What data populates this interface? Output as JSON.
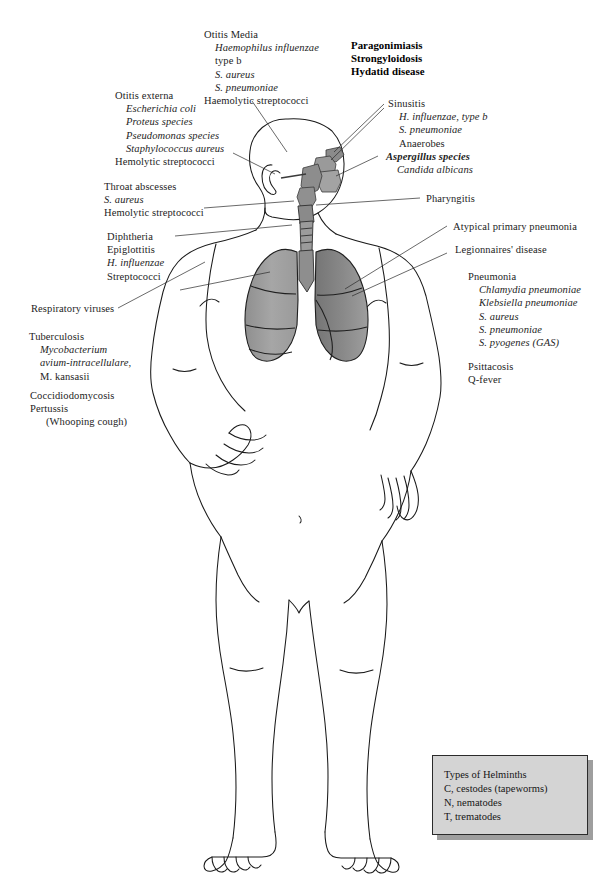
{
  "labels": {
    "otitis_media": {
      "name": "Otitis Media",
      "lines": [
        {
          "text": "Otitis Media",
          "style": "roman",
          "indent": 0
        },
        {
          "text": "Haemophilus influenzae",
          "style": "italic",
          "indent": 1
        },
        {
          "text": "type b",
          "style": "roman",
          "indent": 1
        },
        {
          "text": "S. aureus",
          "style": "italic",
          "indent": 1
        },
        {
          "text": "S. pneumoniae",
          "style": "italic",
          "indent": 1
        },
        {
          "text": "Haemolytic streptococci",
          "style": "roman",
          "indent": 0
        }
      ]
    },
    "helminth_diseases": {
      "name": "Helminth diseases",
      "lines": [
        {
          "text": "Paragonimiasis",
          "style": "roman",
          "indent": 0
        },
        {
          "text": "Strongyloidosis",
          "style": "roman",
          "indent": 0
        },
        {
          "text": "Hydatid disease",
          "style": "roman",
          "indent": 0
        }
      ]
    },
    "otitis_externa": {
      "name": "Otitis externa",
      "lines": [
        {
          "text": "Otitis externa",
          "style": "roman",
          "indent": 0
        },
        {
          "text": "Escherichia coli",
          "style": "italic",
          "indent": 1
        },
        {
          "text": "Proteus species",
          "style": "italic",
          "indent": 1
        },
        {
          "text": "Pseudomonas species",
          "style": "italic",
          "indent": 1
        },
        {
          "text": "Staphylococcus aureus",
          "style": "italic",
          "indent": 1
        },
        {
          "text": "Hemolytic streptococci",
          "style": "roman",
          "indent": 0
        }
      ]
    },
    "sinusitis": {
      "name": "Sinusitis",
      "lines": [
        {
          "text": "Sinusitis",
          "style": "roman",
          "indent": 0
        },
        {
          "text": "H. influenzae, type b",
          "style": "italic",
          "indent": 1
        },
        {
          "text": "S. pneumoniae",
          "style": "italic",
          "indent": 1
        },
        {
          "text": "Anaerobes",
          "style": "roman",
          "indent": 1
        }
      ]
    },
    "fungi": {
      "name": "Fungal pathogens",
      "lines": [
        {
          "text": "Aspergillus species",
          "style": "bolditalic",
          "indent": 0
        },
        {
          "text": "Candida albicans",
          "style": "italic",
          "indent": 1
        }
      ]
    },
    "throat_abscesses": {
      "name": "Throat abscesses",
      "lines": [
        {
          "text": "Throat abscesses",
          "style": "roman",
          "indent": 0
        },
        {
          "text": "S. aureus",
          "style": "italic",
          "indent": 0
        },
        {
          "text": "Hemolytic streptococci",
          "style": "roman",
          "indent": 0
        }
      ]
    },
    "pharyngitis": {
      "name": "Pharyngitis",
      "lines": [
        {
          "text": "Pharyngitis",
          "style": "roman",
          "indent": 0
        }
      ]
    },
    "diphtheria": {
      "name": "Diphtheria and epiglottitis",
      "lines": [
        {
          "text": "Diphtheria",
          "style": "roman",
          "indent": 0
        },
        {
          "text": "Epiglottitis",
          "style": "roman",
          "indent": 0
        },
        {
          "text": "H. influenzae",
          "style": "italic",
          "indent": 0
        },
        {
          "text": "Streptococci",
          "style": "roman",
          "indent": 0
        }
      ]
    },
    "atypical_pneumonia": {
      "name": "Atypical primary pneumonia",
      "lines": [
        {
          "text": "Atypical primary pneumonia",
          "style": "roman",
          "indent": 0
        }
      ]
    },
    "legionnaires": {
      "name": "Legionnaires' disease",
      "lines": [
        {
          "text": "Legionnaires' disease",
          "style": "roman",
          "indent": 0
        }
      ]
    },
    "respiratory_viruses": {
      "name": "Respiratory viruses",
      "lines": [
        {
          "text": "Respiratory viruses",
          "style": "roman",
          "indent": 0
        }
      ]
    },
    "pneumonia": {
      "name": "Pneumonia",
      "lines": [
        {
          "text": "Pneumonia",
          "style": "roman",
          "indent": 0
        },
        {
          "text": "Chlamydia pneumoniae",
          "style": "italic",
          "indent": 1
        },
        {
          "text": "Klebsiella pneumoniae",
          "style": "italic",
          "indent": 1
        },
        {
          "text": "S. aureus",
          "style": "italic",
          "indent": 1
        },
        {
          "text": "S. pneumoniae",
          "style": "italic",
          "indent": 1
        },
        {
          "text": "S. pyogenes (GAS)",
          "style": "italic",
          "indent": 1
        }
      ]
    },
    "tuberculosis": {
      "name": "Tuberculosis",
      "lines": [
        {
          "text": "Tuberculosis",
          "style": "roman",
          "indent": 0
        },
        {
          "text": "Mycobacterium",
          "style": "italic",
          "indent": 1
        },
        {
          "text": "avium-intracellulare,",
          "style": "italic",
          "indent": 1
        },
        {
          "text": "M. kansasii",
          "style": "roman",
          "indent": 1
        }
      ]
    },
    "psittacosis": {
      "name": "Psittacosis and Q-fever",
      "lines": [
        {
          "text": "Psittacosis",
          "style": "roman",
          "indent": 0
        },
        {
          "text": "Q-fever",
          "style": "roman",
          "indent": 0
        }
      ]
    },
    "coccidiodomycosis": {
      "name": "Coccidiodomycosis and pertussis",
      "lines": [
        {
          "text": "Coccidiodomycosis",
          "style": "roman",
          "indent": 0
        },
        {
          "text": "Pertussis",
          "style": "roman",
          "indent": 0
        },
        {
          "text": "(Whooping cough)",
          "style": "roman",
          "indent": 1
        }
      ]
    }
  },
  "legend": {
    "name": "Types of Helminths legend",
    "lines": [
      "Types of Helminths",
      "C, cestodes (tapeworms)",
      "N, nematodes",
      "T, trematodes"
    ],
    "fill_color": "#d4d4d4",
    "shadow_color": "#9e9e9e",
    "border_color": "#2b2b2b"
  },
  "colors": {
    "ink": "#1a1a1a",
    "organ_fill_light": "#a8a8a8",
    "organ_fill_dark": "#7d7d7d",
    "organ_fill_mid": "#949494",
    "background": "#ffffff"
  }
}
